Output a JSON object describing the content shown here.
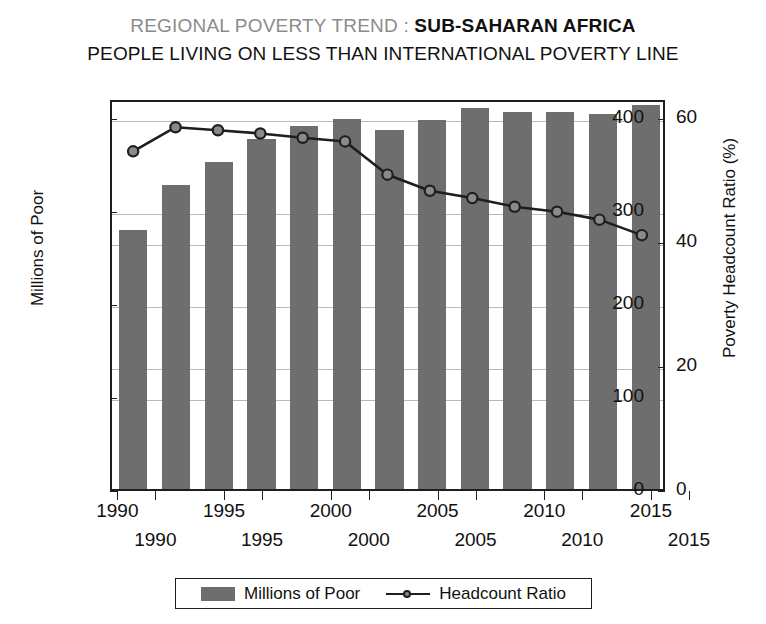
{
  "title": {
    "line1_soft": "REGIONAL POVERTY TREND : ",
    "line1_hard": "SUB-SAHARAN AFRICA",
    "line2": "PEOPLE LIVING ON LESS THAN INTERNATIONAL POVERTY LINE"
  },
  "axes": {
    "left_label": "Millions of Poor",
    "right_label": "Poverty Headcount Ratio (%)",
    "left_ticks": [
      "0",
      "100",
      "200",
      "300",
      "400"
    ],
    "right_ticks": [
      "0",
      "20",
      "40",
      "60"
    ],
    "x_ticks_row1": [
      "1990",
      "1995",
      "2000",
      "2005",
      "2010",
      "2015"
    ],
    "x_ticks_row2": [
      "1990",
      "1995",
      "2000",
      "2005",
      "2010",
      "2015"
    ]
  },
  "legend": {
    "bar_label": "Millions of Poor",
    "line_label": "Headcount Ratio"
  },
  "colors": {
    "bar_fill": "#6e6e6e",
    "line_stroke": "#1e1e1e",
    "marker_fill": "#8a8a8a",
    "gridline": "#b9b9b9",
    "title_soft": "#8b8b8b",
    "title_hard": "#111111"
  },
  "chart_data": {
    "type": "bar",
    "xlabel": "",
    "ylabel": "Millions of Poor",
    "y2label": "Poverty Headcount Ratio (%)",
    "ylim": [
      0,
      420
    ],
    "y2lim": [
      0,
      63
    ],
    "yticks": [
      0,
      100,
      200,
      300,
      400
    ],
    "y2ticks": [
      0,
      20,
      40,
      60
    ],
    "grid": true,
    "legend_position": "bottom",
    "categories": [
      1990,
      1992,
      1994,
      1996,
      1998,
      2000,
      2002,
      2004,
      2006,
      2008,
      2010,
      2012,
      2014
    ],
    "series": [
      {
        "name": "Millions of Poor",
        "type": "bar",
        "axis": "left",
        "unit": "millions",
        "values": [
          278,
          327,
          351,
          376,
          390,
          397,
          386,
          396,
          409,
          405,
          405,
          403,
          413
        ]
      },
      {
        "name": "Headcount Ratio",
        "type": "line",
        "axis": "right",
        "unit": "percent",
        "values": [
          55.0,
          58.9,
          58.4,
          57.9,
          57.2,
          56.6,
          51.2,
          48.6,
          47.4,
          46.0,
          45.2,
          43.9,
          41.4
        ]
      }
    ]
  }
}
